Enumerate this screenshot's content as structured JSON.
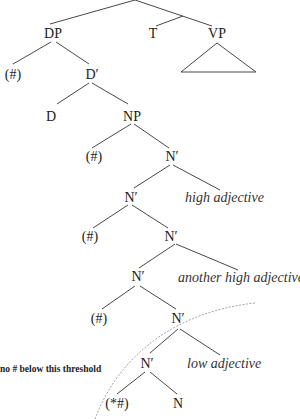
{
  "diagram": {
    "type": "syntax-tree",
    "nodes": {
      "dp": "DP",
      "t": "T",
      "vp": "VP",
      "dp_spec": "(#)",
      "d_bar": "D′",
      "d": "D",
      "np": "NP",
      "np_spec": "(#)",
      "n_bar_1": "N′",
      "n_bar_2": "N′",
      "n_bar_2_spec": "(#)",
      "n_bar_3": "N′",
      "n_bar_4": "N′",
      "n_bar_5_spec": "(#)",
      "n_bar_5": "N′",
      "n_bar_6": "N′",
      "n_bar_6_spec": "(*#)",
      "n": "N"
    },
    "adjuncts": {
      "high_adjective": "high adjective",
      "another_high_adjective": "another high adjective",
      "low_adjective": "low adjective"
    },
    "threshold_label": "no # below this threshold",
    "colors": {
      "text": "#222222",
      "lines": "#333333",
      "threshold_curve": "#9a9a9a",
      "background": "#ffffff"
    }
  }
}
